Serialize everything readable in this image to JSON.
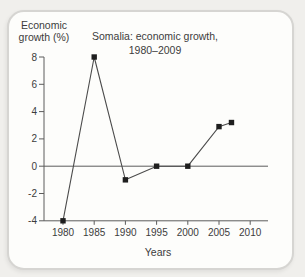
{
  "page": {
    "background_color": "#f0efec",
    "card_background_color": "#fdfdfb",
    "card_border_color": "#d6d5d2"
  },
  "chart": {
    "title_line1": "Somalia: economic growth,",
    "title_line2": "1980–2009",
    "y_axis_title_line1": "Economic",
    "y_axis_title_line2": "growth (%)",
    "x_axis_label": "Years"
  },
  "chart_data": {
    "type": "line",
    "title": "Somalia: economic growth, 1980–2009",
    "xlabel": "Years",
    "ylabel": "Economic growth (%)",
    "x": [
      1980,
      1985,
      1990,
      1995,
      2000,
      2005,
      2007
    ],
    "y": [
      -4,
      8,
      -1,
      0,
      0,
      2.9,
      3.2
    ],
    "x_ticks": [
      1980,
      1985,
      1990,
      1995,
      2000,
      2005,
      2010
    ],
    "y_ticks": [
      8,
      6,
      4,
      2,
      0,
      -2,
      -4
    ],
    "xlim": [
      1977,
      2012.5
    ],
    "ylim": [
      -4,
      8
    ],
    "grid": false,
    "zero_line": true,
    "legend": "none",
    "marker": "square",
    "line_color": "#4b4b4b",
    "marker_color": "#1e1e1e",
    "axis_color": "#5c5c5c",
    "text_color": "#3c3c3c"
  }
}
